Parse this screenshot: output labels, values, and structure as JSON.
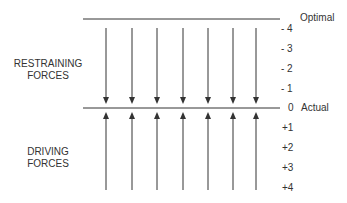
{
  "diagram": {
    "top_line_label": "Optimal",
    "middle_line_label": "Actual",
    "restraining_label": "RESTRAINING\nFORCES",
    "restraining_label_lines": [
      "RESTRAINING",
      "FORCES"
    ],
    "driving_label_lines": [
      "DRIVING",
      "FORCES"
    ],
    "scale_upper": [
      "- 4",
      "- 3",
      "- 2",
      "- 1"
    ],
    "scale_zero": "0",
    "scale_lower": [
      "+1",
      "+2",
      "+3",
      "+4"
    ],
    "restraining_arrow_count": 7,
    "driving_arrow_count": 7,
    "line_color": "#333333"
  }
}
